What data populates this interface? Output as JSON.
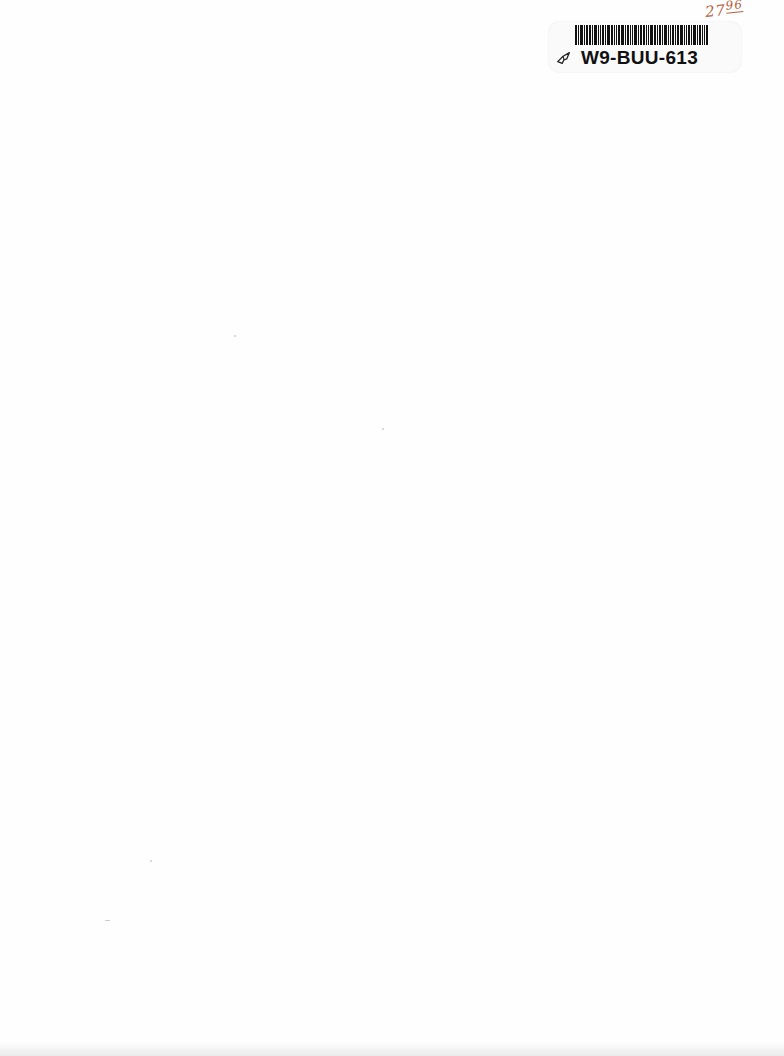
{
  "page": {
    "type": "blank scanned page",
    "background_color": "#fefefe"
  },
  "library_label": {
    "barcode_text": "W9-BUU-613",
    "icon": "book-icon"
  },
  "handwritten_note": {
    "main": "27",
    "superscript": "96"
  }
}
